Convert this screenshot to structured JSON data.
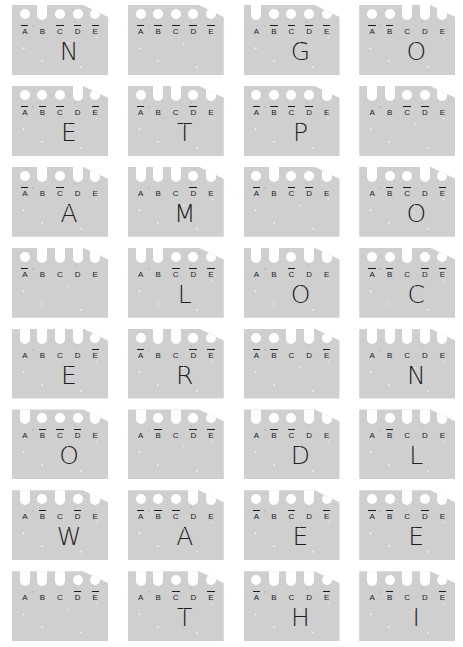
{
  "legend": {
    "positions": [
      "A",
      "B",
      "C",
      "D",
      "E"
    ],
    "overline_marker": "overline",
    "hole_marker": "circle",
    "notch_marker": "slot"
  },
  "card_shape": {
    "body_color": "#cfcfcf",
    "cut_color": "#ffffff",
    "ink_color": "#1b1b1b",
    "clipped_corner": "top-right"
  },
  "grid": {
    "columns": 4,
    "rows": 8,
    "total_cards": 32
  },
  "cards": [
    {
      "index": 1,
      "row": 1,
      "col": 1,
      "glyph": "N",
      "notches": [
        "B"
      ],
      "holes": [
        "A",
        "C",
        "D",
        "E"
      ],
      "overlined": [
        "A",
        "C",
        "D",
        "E"
      ]
    },
    {
      "index": 2,
      "row": 1,
      "col": 2,
      "glyph": "",
      "notches": [],
      "holes": [
        "A",
        "B",
        "C",
        "D",
        "E"
      ],
      "overlined": [
        "A",
        "B",
        "C",
        "D",
        "E"
      ]
    },
    {
      "index": 3,
      "row": 1,
      "col": 3,
      "glyph": "G",
      "notches": [
        "A"
      ],
      "holes": [
        "B",
        "C",
        "D",
        "E"
      ],
      "overlined": [
        "B",
        "C",
        "D",
        "E"
      ]
    },
    {
      "index": 4,
      "row": 1,
      "col": 4,
      "glyph": "O",
      "notches": [
        "C",
        "D",
        "E"
      ],
      "holes": [
        "A",
        "B"
      ],
      "overlined": [
        "A",
        "B"
      ]
    },
    {
      "index": 5,
      "row": 2,
      "col": 1,
      "glyph": "E",
      "notches": [
        "D"
      ],
      "holes": [
        "A",
        "B",
        "C",
        "E"
      ],
      "overlined": [
        "A",
        "B",
        "C",
        "E"
      ]
    },
    {
      "index": 6,
      "row": 2,
      "col": 2,
      "glyph": "T",
      "notches": [
        "B",
        "C",
        "E"
      ],
      "holes": [
        "A",
        "D"
      ],
      "overlined": [
        "A",
        "D"
      ]
    },
    {
      "index": 7,
      "row": 2,
      "col": 3,
      "glyph": "P",
      "notches": [
        "E"
      ],
      "holes": [
        "A",
        "B",
        "C",
        "D"
      ],
      "overlined": [
        "A",
        "B",
        "C",
        "D"
      ]
    },
    {
      "index": 8,
      "row": 2,
      "col": 4,
      "glyph": "",
      "notches": [
        "A",
        "B",
        "E"
      ],
      "holes": [
        "C",
        "D"
      ],
      "overlined": [
        "C",
        "D"
      ]
    },
    {
      "index": 9,
      "row": 3,
      "col": 1,
      "glyph": "A",
      "notches": [
        "B",
        "D",
        "E"
      ],
      "holes": [
        "A",
        "C"
      ],
      "overlined": [
        "A",
        "C"
      ]
    },
    {
      "index": 10,
      "row": 3,
      "col": 2,
      "glyph": "M",
      "notches": [
        "A",
        "B",
        "C",
        "E"
      ],
      "holes": [
        "D"
      ],
      "overlined": [
        "D"
      ]
    },
    {
      "index": 11,
      "row": 3,
      "col": 3,
      "glyph": "",
      "notches": [
        "B",
        "E"
      ],
      "holes": [
        "A",
        "C",
        "D"
      ],
      "overlined": [
        "A",
        "C",
        "D"
      ]
    },
    {
      "index": 12,
      "row": 3,
      "col": 4,
      "glyph": "O",
      "notches": [
        "A",
        "D"
      ],
      "holes": [
        "B",
        "C",
        "E"
      ],
      "overlined": [
        "B",
        "C",
        "E"
      ]
    },
    {
      "index": 13,
      "row": 4,
      "col": 1,
      "glyph": "",
      "notches": [
        "B",
        "C",
        "D",
        "E"
      ],
      "holes": [
        "A"
      ],
      "overlined": [
        "A"
      ]
    },
    {
      "index": 14,
      "row": 4,
      "col": 2,
      "glyph": "L",
      "notches": [
        "A",
        "B"
      ],
      "holes": [
        "C",
        "D",
        "E"
      ],
      "overlined": [
        "C",
        "D",
        "E"
      ]
    },
    {
      "index": 15,
      "row": 4,
      "col": 3,
      "glyph": "O",
      "notches": [
        "A",
        "B",
        "D",
        "E"
      ],
      "holes": [
        "C"
      ],
      "overlined": [
        "C"
      ]
    },
    {
      "index": 16,
      "row": 4,
      "col": 4,
      "glyph": "C",
      "notches": [
        "C"
      ],
      "holes": [
        "A",
        "B",
        "D",
        "E"
      ],
      "overlined": [
        "A",
        "B",
        "D",
        "E"
      ]
    },
    {
      "index": 17,
      "row": 5,
      "col": 1,
      "glyph": "E",
      "notches": [
        "A",
        "B",
        "C",
        "D"
      ],
      "holes": [
        "E"
      ],
      "overlined": [
        "E"
      ]
    },
    {
      "index": 18,
      "row": 5,
      "col": 2,
      "glyph": "R",
      "notches": [
        "B",
        "C"
      ],
      "holes": [
        "A",
        "D",
        "E"
      ],
      "overlined": [
        "A",
        "D",
        "E"
      ]
    },
    {
      "index": 19,
      "row": 5,
      "col": 3,
      "glyph": "",
      "notches": [
        "C",
        "D"
      ],
      "holes": [
        "A",
        "B",
        "E"
      ],
      "overlined": [
        "A",
        "B",
        "E"
      ]
    },
    {
      "index": 20,
      "row": 5,
      "col": 4,
      "glyph": "N",
      "notches": [
        "A",
        "B",
        "C",
        "D",
        "E"
      ],
      "holes": [],
      "overlined": []
    },
    {
      "index": 21,
      "row": 6,
      "col": 1,
      "glyph": "O",
      "notches": [
        "A",
        "E"
      ],
      "holes": [
        "B",
        "C",
        "D"
      ],
      "overlined": [
        "B",
        "C",
        "D"
      ]
    },
    {
      "index": 22,
      "row": 6,
      "col": 2,
      "glyph": "",
      "notches": [
        "A",
        "C"
      ],
      "holes": [
        "B",
        "D",
        "E"
      ],
      "overlined": [
        "B",
        "D",
        "E"
      ]
    },
    {
      "index": 23,
      "row": 6,
      "col": 3,
      "glyph": "D",
      "notches": [
        "A",
        "D",
        "E"
      ],
      "holes": [
        "B",
        "C"
      ],
      "overlined": [
        "B",
        "C"
      ]
    },
    {
      "index": 24,
      "row": 6,
      "col": 4,
      "glyph": "L",
      "notches": [
        "A",
        "C",
        "D",
        "E"
      ],
      "holes": [
        "B"
      ],
      "overlined": [
        "B"
      ]
    },
    {
      "index": 25,
      "row": 7,
      "col": 1,
      "glyph": "W",
      "notches": [
        "A",
        "C",
        "E"
      ],
      "holes": [
        "B",
        "D"
      ],
      "overlined": [
        "B",
        "D"
      ]
    },
    {
      "index": 26,
      "row": 7,
      "col": 2,
      "glyph": "A",
      "notches": [
        "D",
        "E"
      ],
      "holes": [
        "A",
        "B",
        "C"
      ],
      "overlined": [
        "A",
        "B",
        "C"
      ]
    },
    {
      "index": 27,
      "row": 7,
      "col": 3,
      "glyph": "E",
      "notches": [
        "B",
        "D"
      ],
      "holes": [
        "A",
        "C",
        "E"
      ],
      "overlined": [
        "A",
        "C",
        "E"
      ]
    },
    {
      "index": 28,
      "row": 7,
      "col": 4,
      "glyph": "E",
      "notches": [
        "C",
        "E"
      ],
      "holes": [
        "A",
        "B",
        "D"
      ],
      "overlined": [
        "A",
        "B",
        "D"
      ]
    },
    {
      "index": 29,
      "row": 8,
      "col": 1,
      "glyph": "",
      "notches": [
        "A",
        "B",
        "C"
      ],
      "holes": [
        "D",
        "E"
      ],
      "overlined": [
        "D",
        "E"
      ]
    },
    {
      "index": 30,
      "row": 8,
      "col": 2,
      "glyph": "T",
      "notches": [
        "A",
        "B",
        "D"
      ],
      "holes": [
        "C",
        "E"
      ],
      "overlined": [
        "C",
        "E"
      ]
    },
    {
      "index": 31,
      "row": 8,
      "col": 3,
      "glyph": "H",
      "notches": [
        "B",
        "C",
        "D"
      ],
      "holes": [
        "A",
        "E"
      ],
      "overlined": [
        "A",
        "E"
      ]
    },
    {
      "index": 32,
      "row": 8,
      "col": 4,
      "glyph": "I",
      "notches": [
        "A",
        "C",
        "D"
      ],
      "holes": [
        "B",
        "E"
      ],
      "overlined": [
        "B",
        "E"
      ]
    }
  ]
}
